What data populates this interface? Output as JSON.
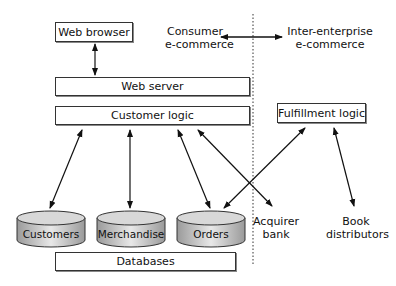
{
  "diagram": {
    "nodes": {
      "web_browser": "Web browser",
      "web_server": "Web server",
      "customer_logic": "Customer logic",
      "fulfillment_logic": "Fulfillment logic",
      "databases": "Databases",
      "acquirer_bank": [
        "Acquirer",
        "bank"
      ],
      "book_distributors": [
        "Book",
        "distributors"
      ]
    },
    "databases": [
      {
        "label": "Customers"
      },
      {
        "label": "Merchandise"
      },
      {
        "label": "Orders"
      }
    ],
    "regions": {
      "consumer": [
        "Consumer",
        "e-commerce"
      ],
      "inter_enterprise": [
        "Inter-enterprise",
        "e-commerce"
      ]
    },
    "colors": {
      "line": "#111111",
      "box_border": "#333333",
      "cylinder_fill_light": "#e8e8e8",
      "cylinder_fill_dark": "#9a9a9a"
    }
  }
}
